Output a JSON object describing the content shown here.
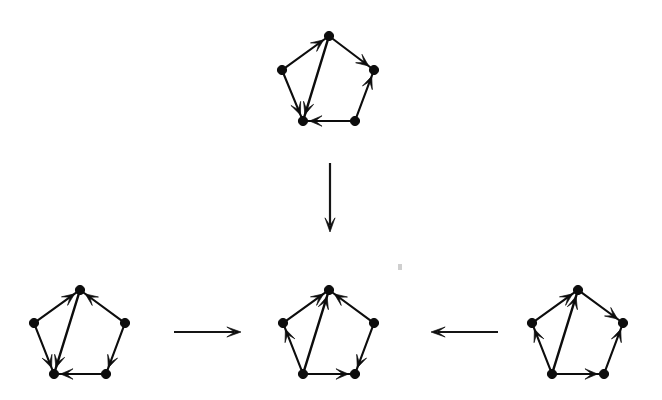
{
  "figure": {
    "title": "Directed pentagon graph transformation",
    "background_color": "#ffffff",
    "ink_color": "#0d0d0d",
    "width": 662,
    "height": 400
  },
  "vertex_names": [
    "top",
    "left",
    "right",
    "bottom-left",
    "bottom-right"
  ],
  "graphs": [
    {
      "id": "top-graph",
      "name": "top-pentagon",
      "label": "",
      "center": {
        "x": 329,
        "y": 80
      },
      "radius": 48,
      "vertices": [
        {
          "key": "top",
          "x": 329,
          "y": 36
        },
        {
          "key": "left",
          "x": 282,
          "y": 70
        },
        {
          "key": "right",
          "x": 374,
          "y": 70
        },
        {
          "key": "bottom-left",
          "x": 303,
          "y": 121
        },
        {
          "key": "bottom-right",
          "x": 355,
          "y": 121
        }
      ],
      "edges": [
        {
          "from": "left",
          "to": "top",
          "kind": "side"
        },
        {
          "from": "top",
          "to": "right",
          "kind": "side"
        },
        {
          "from": "left",
          "to": "bottom-left",
          "kind": "side"
        },
        {
          "from": "bottom-right",
          "to": "right",
          "kind": "side"
        },
        {
          "from": "bottom-right",
          "to": "bottom-left",
          "kind": "side"
        },
        {
          "from": "top",
          "to": "bottom-left",
          "kind": "chord"
        }
      ]
    },
    {
      "id": "left-graph",
      "name": "bottom-left-pentagon",
      "label": "",
      "center": {
        "x": 83,
        "y": 330
      },
      "radius": 48,
      "vertices": [
        {
          "key": "top",
          "x": 80,
          "y": 290
        },
        {
          "key": "left",
          "x": 34,
          "y": 323
        },
        {
          "key": "right",
          "x": 125,
          "y": 323
        },
        {
          "key": "bottom-left",
          "x": 54,
          "y": 374
        },
        {
          "key": "bottom-right",
          "x": 106,
          "y": 374
        }
      ],
      "edges": [
        {
          "from": "left",
          "to": "top",
          "kind": "side"
        },
        {
          "from": "right",
          "to": "top",
          "kind": "side"
        },
        {
          "from": "left",
          "to": "bottom-left",
          "kind": "side"
        },
        {
          "from": "right",
          "to": "bottom-right",
          "kind": "side"
        },
        {
          "from": "bottom-right",
          "to": "bottom-left",
          "kind": "side"
        },
        {
          "from": "top",
          "to": "bottom-left",
          "kind": "chord"
        }
      ]
    },
    {
      "id": "middle-graph",
      "name": "bottom-middle-pentagon",
      "label": "",
      "center": {
        "x": 330,
        "y": 330
      },
      "radius": 48,
      "vertices": [
        {
          "key": "top",
          "x": 329,
          "y": 290
        },
        {
          "key": "left",
          "x": 283,
          "y": 323
        },
        {
          "key": "right",
          "x": 374,
          "y": 323
        },
        {
          "key": "bottom-left",
          "x": 303,
          "y": 374
        },
        {
          "key": "bottom-right",
          "x": 355,
          "y": 374
        }
      ],
      "edges": [
        {
          "from": "left",
          "to": "top",
          "kind": "side"
        },
        {
          "from": "right",
          "to": "top",
          "kind": "side"
        },
        {
          "from": "bottom-left",
          "to": "left",
          "kind": "side"
        },
        {
          "from": "right",
          "to": "bottom-right",
          "kind": "side"
        },
        {
          "from": "bottom-left",
          "to": "bottom-right",
          "kind": "side"
        },
        {
          "from": "bottom-left",
          "to": "top",
          "kind": "chord"
        }
      ]
    },
    {
      "id": "right-graph",
      "name": "bottom-right-pentagon",
      "label": "",
      "center": {
        "x": 578,
        "y": 330
      },
      "radius": 48,
      "vertices": [
        {
          "key": "top",
          "x": 578,
          "y": 290
        },
        {
          "key": "left",
          "x": 532,
          "y": 323
        },
        {
          "key": "right",
          "x": 623,
          "y": 323
        },
        {
          "key": "bottom-left",
          "x": 552,
          "y": 374
        },
        {
          "key": "bottom-right",
          "x": 604,
          "y": 374
        }
      ],
      "edges": [
        {
          "from": "left",
          "to": "top",
          "kind": "side"
        },
        {
          "from": "top",
          "to": "right",
          "kind": "side"
        },
        {
          "from": "bottom-left",
          "to": "left",
          "kind": "side"
        },
        {
          "from": "bottom-right",
          "to": "right",
          "kind": "side"
        },
        {
          "from": "bottom-left",
          "to": "bottom-right",
          "kind": "side"
        },
        {
          "from": "bottom-left",
          "to": "top",
          "kind": "chord"
        }
      ]
    }
  ],
  "connectors": [
    {
      "id": "connector-down",
      "name": "connector-arrow-down",
      "label": "",
      "direction": "down",
      "from": {
        "x": 330,
        "y": 163
      },
      "to": {
        "x": 330,
        "y": 232
      }
    },
    {
      "id": "connector-left-to-middle",
      "name": "connector-arrow-right",
      "label": "",
      "direction": "right",
      "from": {
        "x": 174,
        "y": 332
      },
      "to": {
        "x": 241,
        "y": 332
      }
    },
    {
      "id": "connector-right-to-middle",
      "name": "connector-arrow-left",
      "label": "",
      "direction": "left",
      "from": {
        "x": 498,
        "y": 332
      },
      "to": {
        "x": 431,
        "y": 332
      }
    }
  ],
  "artifacts": [
    {
      "id": "speck-1",
      "name": "scan-speck",
      "x": 398,
      "y": 264,
      "w": 4,
      "h": 6
    }
  ]
}
